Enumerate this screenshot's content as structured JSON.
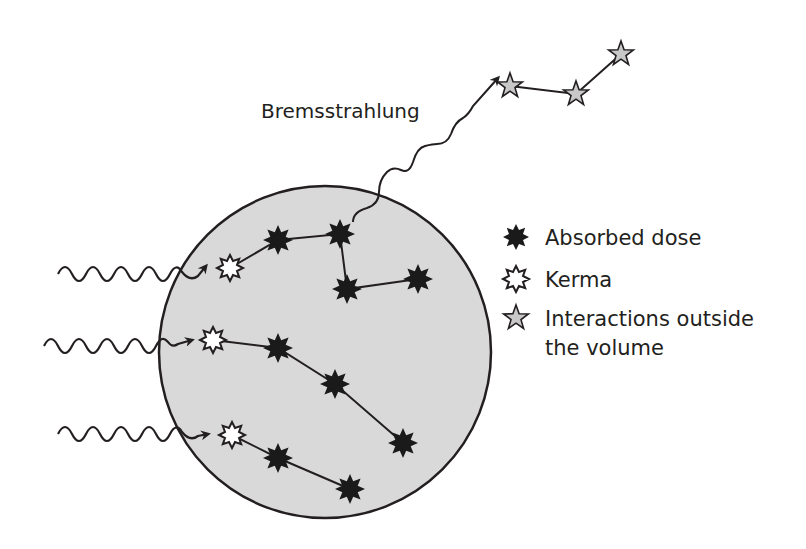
{
  "diagram": {
    "title_label": "Bremsstrahlung",
    "legend": {
      "items": [
        {
          "symbol": "absorbed-dose-star",
          "label": "Absorbed dose"
        },
        {
          "symbol": "kerma-star",
          "label": "Kerma"
        },
        {
          "symbol": "outside-star",
          "label": "Interactions outside",
          "label_line2": "the volume"
        }
      ]
    },
    "colors": {
      "volume_fill": "#d9d9d9",
      "outline": "#231f20",
      "absorbed_star": "#1a1a1a",
      "kerma_star_fill": "#ffffff",
      "outside_star_fill": "#c8c8c8"
    },
    "volume": {
      "cx": 325,
      "cy": 352,
      "r": 166
    },
    "incoming_photons": 3,
    "tracks": [
      {
        "kerma": [
          230,
          268
        ],
        "absorbed": [
          [
            278,
            240
          ],
          [
            340,
            234
          ],
          [
            347,
            289
          ],
          [
            418,
            279
          ]
        ]
      },
      {
        "kerma": [
          213,
          340
        ],
        "absorbed": [
          [
            278,
            348
          ],
          [
            335,
            384
          ],
          [
            403,
            443
          ]
        ]
      },
      {
        "kerma": [
          232,
          435
        ],
        "absorbed": [
          [
            278,
            458
          ],
          [
            350,
            489
          ]
        ]
      }
    ],
    "outside_interactions": [
      [
        510,
        86
      ],
      [
        576,
        94
      ],
      [
        621,
        54
      ]
    ]
  }
}
